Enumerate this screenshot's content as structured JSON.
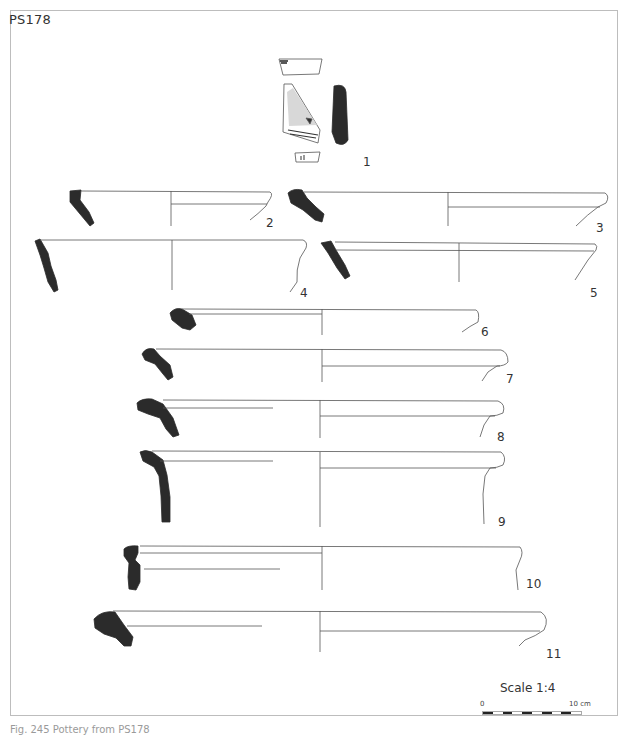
{
  "plate": {
    "label": "PS178",
    "caption": "Fig. 245 Pottery from PS178"
  },
  "sherds": [
    {
      "number": "1",
      "type": "body-sherd-decorated"
    },
    {
      "number": "2",
      "type": "rim-profile"
    },
    {
      "number": "3",
      "type": "rim-profile"
    },
    {
      "number": "4",
      "type": "rim-profile"
    },
    {
      "number": "5",
      "type": "rim-profile"
    },
    {
      "number": "6",
      "type": "rim-profile"
    },
    {
      "number": "7",
      "type": "rim-profile"
    },
    {
      "number": "8",
      "type": "rim-profile"
    },
    {
      "number": "9",
      "type": "rim-profile"
    },
    {
      "number": "10",
      "type": "rim-profile"
    },
    {
      "number": "11",
      "type": "rim-profile"
    }
  ],
  "scale": {
    "title": "Scale 1:4",
    "start": "0",
    "end": "10 cm",
    "segments": 10
  },
  "colors": {
    "section_fill": "#2b2b2b",
    "line": "#555555",
    "frame": "#bdbdbd"
  }
}
